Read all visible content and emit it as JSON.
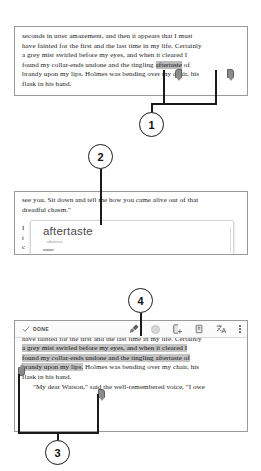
{
  "callouts": [
    {
      "id": "1",
      "label": "1"
    },
    {
      "id": "2",
      "label": "2"
    },
    {
      "id": "3",
      "label": "3"
    },
    {
      "id": "4",
      "label": "4"
    }
  ],
  "panel_top": {
    "lines": [
      "seconds in utter amazement, and then it appears that I must",
      "have fainted for the first and the last time in my life. Certainly",
      "a grey mist swirled before my eyes, and when it cleared I",
      "found my collar-ends undone and the tingling ",
      "brandy upon my lips. Holmes was bending over my chair, his",
      "flask in his hand."
    ],
    "highlighted_word": "aftertaste",
    "line4_tail": " of",
    "selection_handles": [
      "start-handle",
      "end-handle"
    ]
  },
  "panel_middle": {
    "lines": [
      "see you. Sit down and tell me how you came alive out of that",
      "dreadful chasm.\""
    ],
    "obscured_line_fragments": [
      "I",
      "t",
      "c"
    ],
    "dictionary": {
      "word": "aftertaste",
      "pronunciation": "ˈaftəteɪst",
      "part_of_speech": "noun",
      "definition": "1. a taste remaining in the mouth after eating or drinking something."
    }
  },
  "panel_bottom": {
    "toolbar": {
      "done_label": "DONE",
      "icons": [
        {
          "name": "check-icon",
          "label": "Done"
        },
        {
          "name": "highlighter-icon",
          "label": "Highlight"
        },
        {
          "name": "color-swatch-icon",
          "label": "Highlight colour"
        },
        {
          "name": "add-note-icon",
          "label": "Add note"
        },
        {
          "name": "copy-icon",
          "label": "Copy"
        },
        {
          "name": "translate-icon",
          "label": "Translate"
        },
        {
          "name": "overflow-menu-icon",
          "label": "More options"
        }
      ],
      "translate_glyph": "文A"
    },
    "lines": [
      "seconds in utter amazement, and then it appears that I must",
      "have fainted for the first and the last time in my life. Certainly",
      "a grey mist swirled before my eyes, and when it cleared I",
      "found my collar-ends undone and the tingling aftertaste of",
      "brandy upon my lips.",
      " Holmes was bending over my chair, his",
      "flask in his hand.",
      "\"My dear Watson,\" said the well-remembered voice, \"I owe"
    ],
    "selection_handles": [
      "start-handle",
      "end-handle"
    ]
  },
  "colors": {
    "highlight": "#b9b9b9",
    "handle": "#8c8c8c",
    "panel_border": "#9a9a9a",
    "callout_stroke": "#1a1a1a",
    "toolbar_bg": "#fbfbfb"
  }
}
